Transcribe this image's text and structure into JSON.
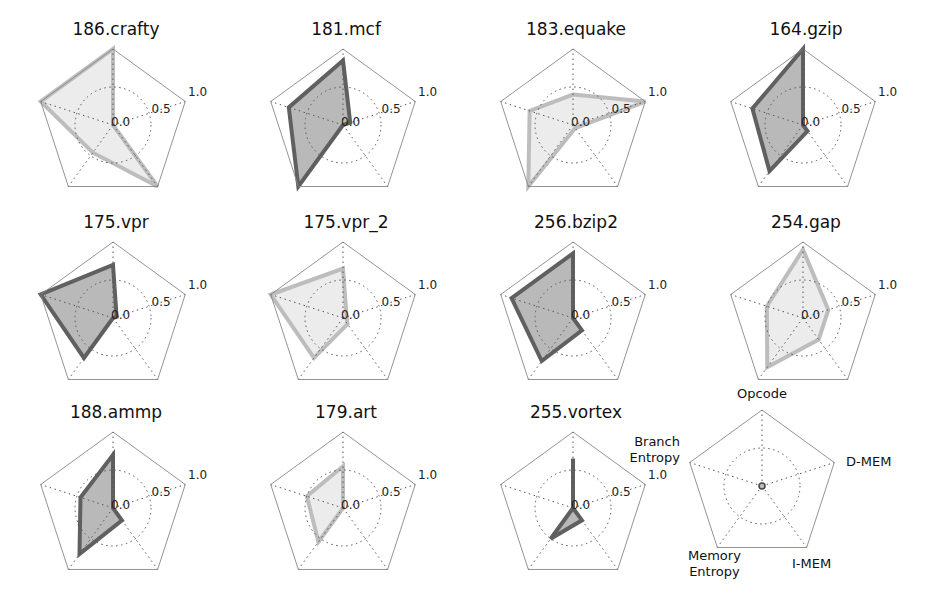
{
  "chart_data": {
    "type": "radar",
    "title": "",
    "axes": [
      "Opcode",
      "D-MEM",
      "I-MEM",
      "Memory Entropy",
      "Branch Entropy"
    ],
    "radial_ticks": [
      "0.0",
      "0.5",
      "1.0"
    ],
    "rlim": [
      0,
      1.0
    ],
    "grid": true,
    "colors": {
      "dark_fill": "#b9b9b9",
      "dark_line": "#606060",
      "light_fill": "#ececec",
      "light_line": "#bdbdbd"
    },
    "series": [
      {
        "name": "186.crafty",
        "style": "light",
        "values": [
          1.0,
          0.0,
          1.0,
          0.45,
          1.0
        ]
      },
      {
        "name": "181.mcf",
        "style": "dark",
        "values": [
          0.85,
          0.1,
          0.0,
          1.0,
          0.75
        ]
      },
      {
        "name": "183.equake",
        "style": "light",
        "values": [
          0.4,
          1.0,
          0.05,
          1.0,
          0.6
        ]
      },
      {
        "name": "164.gzip",
        "style": "dark",
        "values": [
          1.0,
          0.0,
          0.1,
          0.75,
          0.7
        ]
      },
      {
        "name": "175.vpr",
        "style": "dark",
        "values": [
          0.7,
          0.05,
          0.0,
          0.65,
          1.0
        ]
      },
      {
        "name": "175.vpr_2",
        "style": "light",
        "values": [
          0.65,
          0.05,
          0.1,
          0.65,
          1.0
        ]
      },
      {
        "name": "256.bzip2",
        "style": "dark",
        "values": [
          0.85,
          0.0,
          0.2,
          0.7,
          0.85
        ]
      },
      {
        "name": "254.gap",
        "style": "light",
        "values": [
          0.9,
          0.35,
          0.35,
          0.8,
          0.5
        ]
      },
      {
        "name": "188.ammp",
        "style": "dark",
        "values": [
          0.7,
          0.0,
          0.2,
          0.75,
          0.45
        ]
      },
      {
        "name": "179.art",
        "style": "light",
        "values": [
          0.55,
          0.0,
          0.0,
          0.55,
          0.5
        ]
      },
      {
        "name": "255.vortex",
        "style": "dark",
        "values": [
          0.65,
          0.0,
          0.2,
          0.5,
          0.0
        ]
      }
    ],
    "legend_panel": {
      "labels": [
        "Opcode",
        "D-MEM",
        "I-MEM",
        "Memory\nEntropy",
        "Branch\nEntropy"
      ]
    }
  }
}
